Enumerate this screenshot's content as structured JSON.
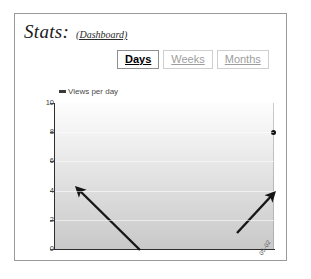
{
  "header": {
    "title": "Stats:",
    "dashboard_link": "(Dashboard)"
  },
  "tabs": [
    {
      "label": "Days",
      "active": true
    },
    {
      "label": "Weeks",
      "active": false
    },
    {
      "label": "Months",
      "active": false
    }
  ],
  "chart_data": {
    "type": "line",
    "title": "",
    "legend": [
      "Views per day"
    ],
    "legend_position": "top-left",
    "xlabel": "",
    "ylabel": "",
    "ylim": [
      0,
      10
    ],
    "yticks": [
      10,
      8,
      6,
      4,
      2,
      0
    ],
    "grid": false,
    "series": [
      {
        "name": "Views per day",
        "color": "#111111",
        "x": [
          "05-02"
        ],
        "values": [
          8
        ]
      }
    ],
    "xtick_labels": [
      "05-02"
    ],
    "annotations": [
      {
        "name": "arrow-left",
        "type": "arrow",
        "from_x": 125,
        "from_y": 180,
        "to_x": 62,
        "to_y": 118
      },
      {
        "name": "arrow-right",
        "type": "arrow",
        "from_x": 222,
        "from_y": 163,
        "to_x": 259,
        "to_y": 123
      }
    ]
  },
  "colors": {
    "panel_border": "#9a9a9a",
    "axis": "#2e2e2e",
    "plot_top": "#fdfdfd",
    "plot_bottom": "#c9c9c9",
    "tab_active_text": "#000000",
    "tab_inactive_text": "#9d9d9d",
    "marker": "#111111"
  }
}
